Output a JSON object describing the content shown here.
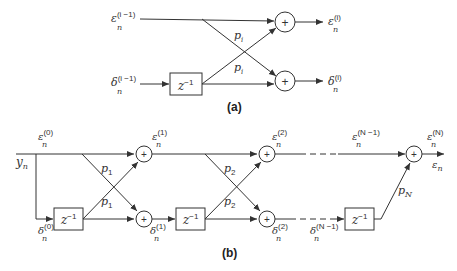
{
  "diagram_a": {
    "caption": "(a)",
    "inputs": {
      "eps": "ε",
      "delta": "δ",
      "sub": "n",
      "sup_in": "(i −1)",
      "sup_out": "(i)"
    },
    "delay_label": "z",
    "delay_exp": "−1",
    "coef": "p",
    "coef_sub": "i",
    "sum_symbol": "+"
  },
  "diagram_b": {
    "caption": "(b)",
    "input": "y",
    "input_sub": "n",
    "eps": "ε",
    "delta": "δ",
    "n": "n",
    "sup0": "(0)",
    "sup1": "(1)",
    "sup2": "(2)",
    "supN1": "(N −1)",
    "supN": "(N)",
    "delay_label": "z",
    "delay_exp": "−1",
    "coef": "p",
    "coef1": "1",
    "coef2": "2",
    "coefN": "N",
    "sum_symbol": "+",
    "output": "ε",
    "output_sub": "n"
  }
}
